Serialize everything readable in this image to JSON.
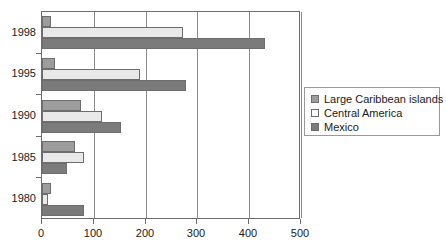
{
  "chart_data": {
    "type": "bar",
    "orientation": "horizontal",
    "title": "",
    "xlabel": "",
    "ylabel": "",
    "categories": [
      "1998",
      "1995",
      "1990",
      "1985",
      "1980"
    ],
    "xlim": [
      0,
      500
    ],
    "xticks": [
      0,
      100,
      200,
      300,
      400,
      500
    ],
    "xtick_labels": [
      "0",
      "100",
      "200",
      "300",
      "400",
      "500"
    ],
    "grid": true,
    "grid_axis": "x",
    "legend_position": "right",
    "series": [
      {
        "name": "Large Caribbean islands",
        "color": "#9d9d9d",
        "values": [
          18,
          25,
          75,
          63,
          18
        ]
      },
      {
        "name": "Central America",
        "color": "#e9e9e9",
        "values": [
          273,
          190,
          115,
          82,
          12
        ]
      },
      {
        "name": "Mexico",
        "color": "#7b7b7b",
        "values": [
          430,
          278,
          152,
          48,
          82
        ]
      }
    ]
  },
  "legend": {
    "items": [
      {
        "label": "Large Caribbean islands",
        "swatch": "legend-swatch-caribbean"
      },
      {
        "label": "Central America",
        "swatch": "legend-swatch-central-america"
      },
      {
        "label": "Mexico",
        "swatch": "legend-swatch-mexico"
      }
    ]
  },
  "axes": {
    "x_tick_labels": [
      "0",
      "100",
      "200",
      "300",
      "400",
      "500"
    ],
    "y_tick_labels": [
      "1998",
      "1995",
      "1990",
      "1985",
      "1980"
    ]
  },
  "colors": {
    "series_caribbean": "#9d9d9d",
    "series_central_america": "#e9e9e9",
    "series_mexico": "#7b7b7b",
    "axis": "#6e6e6e",
    "grid": "#8a8a8a",
    "background": "#ffffff"
  }
}
